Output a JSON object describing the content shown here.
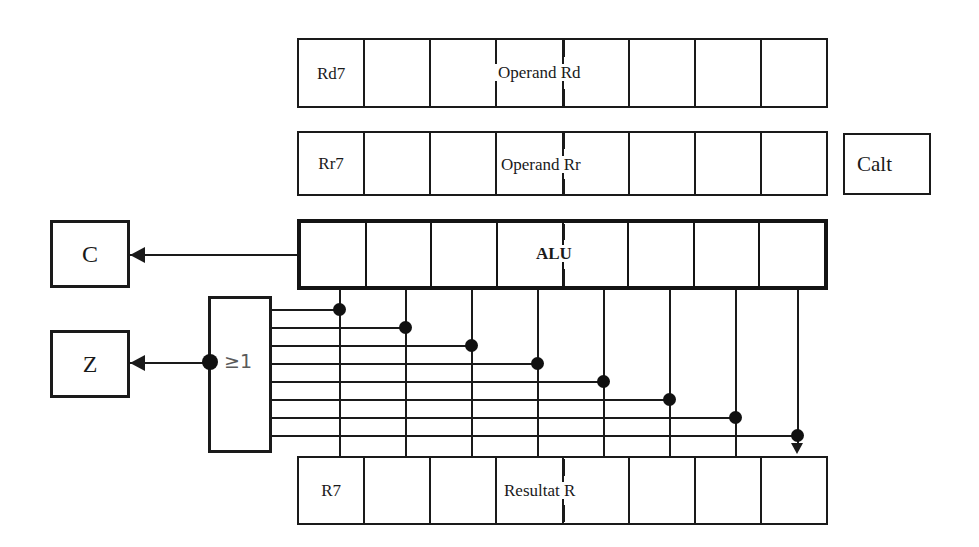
{
  "diagram": {
    "colors": {
      "line": "#1a1a1a",
      "label_gray": "#5a5a5a",
      "background": "#ffffff"
    }
  },
  "rows": [
    {
      "id": "operand-rd",
      "name": "operand-rd-row",
      "first_cell_label": "Rd7",
      "span_label": "Operand Rd",
      "cell_count": 8,
      "emphasis": false
    },
    {
      "id": "operand-rr",
      "name": "operand-rr-row",
      "first_cell_label": "Rr7",
      "span_label": "Operand Rr",
      "cell_count": 8,
      "emphasis": false
    },
    {
      "id": "alu",
      "name": "alu-row",
      "first_cell_label": "",
      "span_label": "ALU",
      "cell_count": 8,
      "emphasis": true
    },
    {
      "id": "result",
      "name": "result-row",
      "first_cell_label": "R7",
      "span_label": "Resultat R",
      "cell_count": 8,
      "emphasis": false
    }
  ],
  "flags": {
    "carry": {
      "label": "C",
      "name": "carry-flag-box"
    },
    "zero": {
      "label": "Z",
      "name": "zero-flag-box"
    },
    "calt": {
      "label": "Calt",
      "name": "calt-box"
    }
  },
  "or_gate": {
    "label": "≥1",
    "name": "or-gate",
    "input_count": 8,
    "description": "eight-input OR gate feeding the Z flag"
  },
  "wires": {
    "carry_arrow_label": "",
    "zero_arrow_label": "",
    "bit_tap_count": 8
  }
}
